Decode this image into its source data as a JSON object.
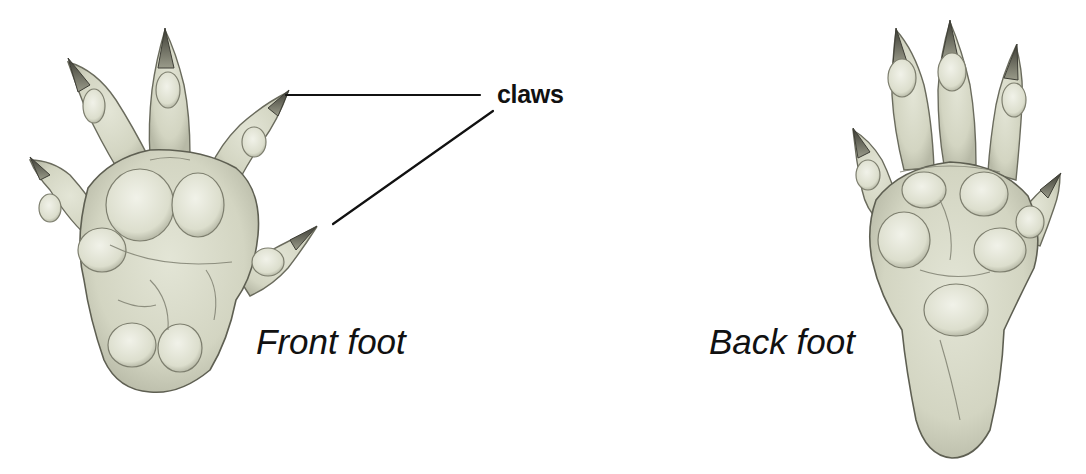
{
  "diagram": {
    "type": "labeled-illustration",
    "labels": {
      "claws": "claws",
      "front_foot": "Front foot",
      "back_foot": "Back foot"
    },
    "callouts": [
      {
        "label": "claws",
        "points_to": "front foot upper-right claw"
      },
      {
        "label": "claws",
        "points_to": "front foot thumb claw"
      }
    ],
    "figures": [
      {
        "name": "Front foot",
        "digits": 5,
        "description": "broad palm with five clawed toes"
      },
      {
        "name": "Back foot",
        "digits": 5,
        "description": "elongated sole with five clawed toes"
      }
    ],
    "colors": {
      "skin": "#d9dccb",
      "pad": "#eceee2",
      "shade": "#8f9080",
      "outline": "#5e5f52",
      "claw": "#4a4a42",
      "line": "#111111"
    }
  }
}
